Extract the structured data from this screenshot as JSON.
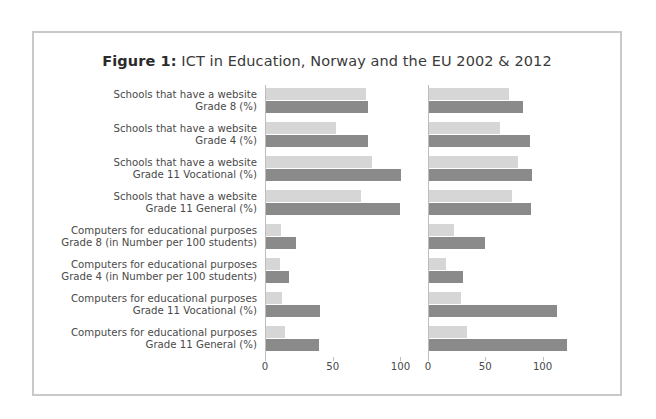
{
  "figure": {
    "label": "Figure 1:",
    "title": " ICT in Education, Norway and the EU 2002 & 2012"
  },
  "chart_data": {
    "type": "bar",
    "orientation": "horizontal",
    "title": "Figure 1: ICT in Education, Norway and the EU 2002 & 2012",
    "xlabel": "",
    "ylabel": "",
    "grid": false,
    "legend_position": "none",
    "panels": [
      {
        "name": "panel-left",
        "xlim": [
          0,
          110
        ],
        "xticks": [
          0,
          50,
          100
        ],
        "xtick_labels": [
          "0",
          "50",
          "100"
        ]
      },
      {
        "name": "panel-right",
        "xlim": [
          0,
          130
        ],
        "xticks": [
          0,
          50,
          100
        ],
        "xtick_labels": [
          "0",
          "50",
          "100"
        ]
      }
    ],
    "categories": [
      {
        "line1": "Schools that have a website",
        "line2": "Grade 8 (%)"
      },
      {
        "line1": "Schools that have a website",
        "line2": "Grade 4 (%)"
      },
      {
        "line1": "Schools that have a website",
        "line2": "Grade 11 Vocational (%)"
      },
      {
        "line1": "Schools that have a website",
        "line2": "Grade 11 General (%)"
      },
      {
        "line1": "Computers for educational purposes",
        "line2": "Grade 8 (in Number per 100 students)"
      },
      {
        "line1": "Computers for educational purposes",
        "line2": "Grade 4 (in Number per 100 students)"
      },
      {
        "line1": "Computers for educational purposes",
        "line2": "Grade 11 Vocational (%)"
      },
      {
        "line1": "Computers for educational purposes",
        "line2": "Grade 11 General (%)"
      }
    ],
    "series": [
      {
        "name": "2002",
        "color": "#d6d6d6",
        "panel_left": [
          74,
          52,
          78,
          70
        ],
        "panel_right": [
          70,
          62,
          78,
          72
        ],
        "panel_left_lower": [
          11,
          10,
          12,
          14
        ],
        "panel_right_lower": [
          22,
          15,
          28,
          33
        ]
      },
      {
        "name": "2012",
        "color": "#8a8a8a",
        "panel_left": [
          75,
          75,
          100,
          99
        ],
        "panel_right": [
          82,
          88,
          90,
          89
        ],
        "panel_left_lower": [
          22,
          17,
          40,
          39
        ],
        "panel_right_lower": [
          49,
          30,
          112,
          120
        ]
      }
    ],
    "values_left": [
      {
        "light": 74,
        "dark": 75
      },
      {
        "light": 52,
        "dark": 75
      },
      {
        "light": 78,
        "dark": 100
      },
      {
        "light": 70,
        "dark": 99
      },
      {
        "light": 11,
        "dark": 22
      },
      {
        "light": 10,
        "dark": 17
      },
      {
        "light": 12,
        "dark": 40
      },
      {
        "light": 14,
        "dark": 39
      }
    ],
    "values_right": [
      {
        "light": 70,
        "dark": 82
      },
      {
        "light": 62,
        "dark": 88
      },
      {
        "light": 78,
        "dark": 90
      },
      {
        "light": 72,
        "dark": 89
      },
      {
        "light": 22,
        "dark": 49
      },
      {
        "light": 15,
        "dark": 30
      },
      {
        "light": 28,
        "dark": 112
      },
      {
        "light": 33,
        "dark": 120
      }
    ]
  }
}
